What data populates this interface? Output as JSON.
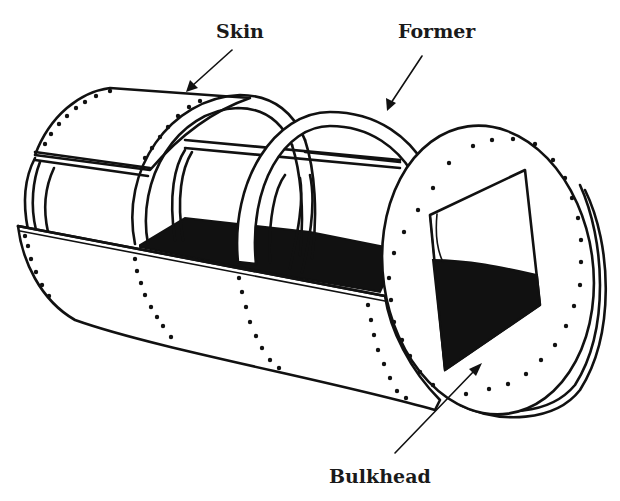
{
  "diagram": {
    "type": "technical-illustration",
    "colors": {
      "line": "#111111",
      "background": "#ffffff",
      "fill_dark": "#111111"
    },
    "labels": [
      {
        "id": "skin",
        "text": "Skin",
        "points_to": "upper skin panel"
      },
      {
        "id": "former",
        "text": "Former",
        "points_to": "second ring former"
      },
      {
        "id": "bulkhead",
        "text": "Bulkhead",
        "points_to": "end bulkhead with rectangular opening"
      }
    ],
    "components": [
      "skin panels",
      "stringers",
      "formers (2 rings)",
      "bulkhead",
      "floor",
      "rivet lines"
    ]
  }
}
